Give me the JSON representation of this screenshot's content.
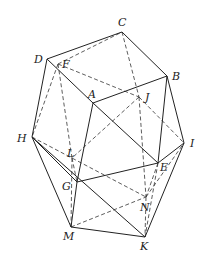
{
  "figure": {
    "type": "polyhedron",
    "vertices": {
      "A": [
        93,
        103
      ],
      "B": [
        167,
        76
      ],
      "C": [
        122,
        32
      ],
      "D": [
        47,
        59
      ],
      "E": [
        158,
        163
      ],
      "F": [
        58,
        64
      ],
      "G": [
        77,
        182
      ],
      "H": [
        32,
        137
      ],
      "I": [
        184,
        143
      ],
      "J": [
        139,
        97
      ],
      "K": [
        145,
        237
      ],
      "L": [
        72,
        158
      ],
      "M": [
        71,
        227
      ],
      "N": [
        146,
        197
      ]
    },
    "labels": {
      "A": {
        "text": "A",
        "x": 88,
        "y": 98
      },
      "B": {
        "text": "B",
        "x": 172,
        "y": 80
      },
      "C": {
        "text": "C",
        "x": 118,
        "y": 26
      },
      "D": {
        "text": "D",
        "x": 34,
        "y": 63
      },
      "E": {
        "text": "E",
        "x": 160,
        "y": 171
      },
      "F": {
        "text": "F",
        "x": 62,
        "y": 68
      },
      "G": {
        "text": "G",
        "x": 62,
        "y": 190
      },
      "H": {
        "text": "H",
        "x": 17,
        "y": 142
      },
      "I": {
        "text": "I",
        "x": 190,
        "y": 147
      },
      "J": {
        "text": "J",
        "x": 145,
        "y": 101
      },
      "K": {
        "text": "K",
        "x": 140,
        "y": 250
      },
      "L": {
        "text": "L",
        "x": 67,
        "y": 157
      },
      "M": {
        "text": "M",
        "x": 63,
        "y": 240
      },
      "N": {
        "text": "N",
        "x": 140,
        "y": 211
      }
    },
    "solid_edges": [
      [
        "D",
        "C"
      ],
      [
        "C",
        "B"
      ],
      [
        "D",
        "A"
      ],
      [
        "A",
        "B"
      ],
      [
        "D",
        "H"
      ],
      [
        "A",
        "G"
      ],
      [
        "B",
        "E"
      ],
      [
        "B",
        "I"
      ],
      [
        "H",
        "G"
      ],
      [
        "H",
        "M"
      ],
      [
        "H",
        "K"
      ],
      [
        "G",
        "E"
      ],
      [
        "G",
        "M"
      ],
      [
        "E",
        "I"
      ],
      [
        "I",
        "K"
      ],
      [
        "M",
        "K"
      ],
      [
        "A",
        "E"
      ]
    ],
    "dashed_edges": [
      [
        "F",
        "C"
      ],
      [
        "F",
        "J"
      ],
      [
        "C",
        "J"
      ],
      [
        "J",
        "I"
      ],
      [
        "J",
        "L"
      ],
      [
        "J",
        "N"
      ],
      [
        "F",
        "H"
      ],
      [
        "F",
        "L"
      ],
      [
        "H",
        "N"
      ],
      [
        "L",
        "G"
      ],
      [
        "L",
        "M"
      ],
      [
        "M",
        "N"
      ],
      [
        "N",
        "K"
      ],
      [
        "N",
        "I"
      ],
      [
        "E",
        "N"
      ],
      [
        "E",
        "K"
      ]
    ]
  }
}
